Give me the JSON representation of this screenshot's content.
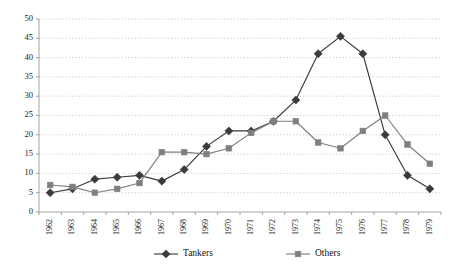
{
  "chart_data": {
    "type": "line",
    "title": "",
    "subtitle": "",
    "xlabel": "",
    "ylabel": "",
    "categories": [
      "1962",
      "1963",
      "1964",
      "1965",
      "1966",
      "1967",
      "1968",
      "1969",
      "1970",
      "1971",
      "1972",
      "1973",
      "1974",
      "1975",
      "1976",
      "1977",
      "1978",
      "1979"
    ],
    "series": [
      {
        "name": "Tankers",
        "marker": "diamond",
        "color": "#3b3b3b",
        "values": [
          5,
          6,
          8.5,
          9,
          9.5,
          8,
          11,
          17,
          21,
          21,
          23.5,
          29,
          41,
          45.5,
          41,
          20,
          9.5,
          6
        ]
      },
      {
        "name": "Others",
        "marker": "square",
        "color": "#7f7f7f",
        "values": [
          7,
          6.5,
          5,
          6,
          7.5,
          15.5,
          15.5,
          15,
          16.5,
          20.5,
          23.5,
          23.5,
          18,
          16.5,
          21,
          25,
          17.5,
          12.5
        ]
      }
    ],
    "ylim": [
      0,
      50
    ],
    "yticks": [
      0,
      5,
      10,
      15,
      20,
      25,
      30,
      35,
      40,
      45,
      50
    ],
    "ytick_labels": [
      "0",
      "5",
      "10",
      "15",
      "20",
      "25",
      "30",
      "35",
      "40",
      "45",
      "50"
    ],
    "grid": true,
    "grid_color": "#c8c8c8",
    "legend_position": "bottom",
    "legend": [
      {
        "label": "Tankers",
        "marker": "diamond",
        "color": "#3b3b3b"
      },
      {
        "label": "Others",
        "marker": "square",
        "color": "#7f7f7f"
      }
    ]
  }
}
